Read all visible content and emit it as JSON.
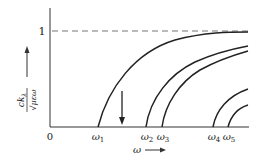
{
  "diagram": {
    "type": "dispersion-curves",
    "y_axis": {
      "label_numerator": "ckλ",
      "label_numerator_main": "ck",
      "label_numerator_sub": "λ",
      "label_denominator": "√μεω",
      "tick_label": "1",
      "tick_value": 1
    },
    "x_axis": {
      "label": "ω",
      "origin_label": "0",
      "arrow": "→",
      "cutoffs": [
        {
          "label": "ω",
          "sub": "1",
          "name": "omega-1"
        },
        {
          "label": "ω",
          "sub": "2",
          "name": "omega-2"
        },
        {
          "label": "ω",
          "sub": "3",
          "name": "omega-3"
        },
        {
          "label": "ω",
          "sub": "4",
          "name": "omega-4"
        },
        {
          "label": "ω",
          "sub": "5",
          "name": "omega-5"
        }
      ]
    },
    "asymptote": {
      "value": 1,
      "style": "dashed"
    },
    "marker_arrow": {
      "direction": "down",
      "position": "between ω1 and ω2"
    },
    "curve_count": 5
  },
  "colors": {
    "line": "#222222",
    "dashed": "#777777",
    "background": "#ffffff"
  }
}
